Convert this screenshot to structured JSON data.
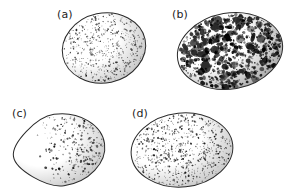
{
  "figure": {
    "type": "scientific-illustration",
    "background_color": "#ffffff",
    "ink_color": "#1d1d1d",
    "width": 287,
    "height": 193,
    "panel_count": 4
  },
  "panels": [
    {
      "id": "a",
      "label": "(a)",
      "label_x": 57,
      "label_y": 9,
      "description": "rounded oval egg with fine, fairly even dark speckling over the whole shell, slightly denser toward the upper right",
      "egg": {
        "cx": 104,
        "cy": 48,
        "rx": 42,
        "ry": 35,
        "rotation": -12,
        "outline_color": "#2a2a2a",
        "outline_width": 1.0,
        "shade_side": "right"
      },
      "markings": {
        "style": "fine-speckle",
        "count": 560,
        "min_size": 0.7,
        "max_size": 2.0,
        "color": "#4a4a4a",
        "dark_color": "#1a1a1a",
        "coverage": "uniform",
        "density_bias": "upper-right",
        "bias_strength": 0.35,
        "seed": 1207
      }
    },
    {
      "id": "b",
      "label": "(b)",
      "label_x": 172,
      "label_y": 9,
      "description": "broad oval egg heavily blotched with large irregular near-black markings covering most of the shell",
      "egg": {
        "cx": 230,
        "cy": 51,
        "rx": 53,
        "ry": 38,
        "rotation": -10,
        "outline_color": "#2a2a2a",
        "outline_width": 1.0,
        "shade_side": "right"
      },
      "markings": {
        "style": "heavy-blotch",
        "count": 900,
        "min_size": 1.0,
        "max_size": 4.2,
        "color": "#2b2b2b",
        "dark_color": "#000000",
        "coverage": "dense",
        "density_bias": "uniform",
        "bias_strength": 0.15,
        "seed": 4411
      }
    },
    {
      "id": "c",
      "label": "(c)",
      "label_x": 12,
      "label_y": 108,
      "description": "pointed oval egg nearly unmarked at the narrow left end, with a dense dark cap of speckling concentrated at the blunt right end",
      "egg": {
        "cx": 59,
        "cy": 150,
        "rx": 46,
        "ry": 36,
        "rotation": -8,
        "outline_color": "#2a2a2a",
        "outline_width": 1.0,
        "shade_side": "right",
        "shape": "pyriform"
      },
      "markings": {
        "style": "capped-speckle",
        "count": 620,
        "min_size": 0.7,
        "max_size": 2.6,
        "color": "#3d3d3d",
        "dark_color": "#101010",
        "coverage": "zoned",
        "density_bias": "right-cap",
        "bias_strength": 0.9,
        "seed": 2903
      }
    },
    {
      "id": "d",
      "label": "(d)",
      "label_x": 132,
      "label_y": 108,
      "description": "rounded oval egg with small crisp dark dots spread evenly across the whole shell",
      "egg": {
        "cx": 182,
        "cy": 150,
        "rx": 51,
        "ry": 37,
        "rotation": -6,
        "outline_color": "#2a2a2a",
        "outline_width": 1.0,
        "shade_side": "right"
      },
      "markings": {
        "style": "even-dots",
        "count": 700,
        "min_size": 0.8,
        "max_size": 2.1,
        "color": "#3a3a3a",
        "dark_color": "#141414",
        "coverage": "uniform",
        "density_bias": "uniform",
        "bias_strength": 0.1,
        "seed": 7755
      }
    }
  ]
}
